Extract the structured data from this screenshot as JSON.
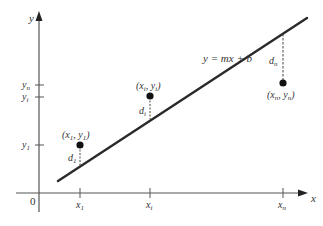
{
  "diagram": {
    "axes": {
      "x_label": "x",
      "y_label": "y",
      "origin_label": "0",
      "x_ticks": [
        {
          "base": "x",
          "sub": "1"
        },
        {
          "base": "x",
          "sub": "i"
        },
        {
          "base": "x",
          "sub": "n"
        }
      ],
      "y_ticks": [
        {
          "base": "y",
          "sub": "n"
        },
        {
          "base": "y",
          "sub": "i"
        },
        {
          "base": "y",
          "sub": "1"
        }
      ]
    },
    "line_label": "y = mx + b",
    "points": [
      {
        "label_x": "x",
        "sub_x": "1",
        "label_y": "y",
        "sub_y": "1",
        "deviation": "d",
        "deviation_sub": "1"
      },
      {
        "label_x": "x",
        "sub_x": "i",
        "label_y": "y",
        "sub_y": "i",
        "deviation": "d",
        "deviation_sub": "i"
      },
      {
        "label_x": "x",
        "sub_x": "n",
        "label_y": "y",
        "sub_y": "n",
        "deviation": "d",
        "deviation_sub": "n"
      }
    ],
    "colors": {
      "line": "#2a2a2a",
      "axis": "#555555",
      "point": "#111111",
      "text": "#333333"
    }
  }
}
